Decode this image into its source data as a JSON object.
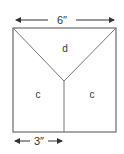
{
  "diagram": {
    "top_dimension": "6″",
    "bottom_dimension": "3″",
    "regions": {
      "top": "d",
      "bottom_left": "c",
      "bottom_right": "c"
    },
    "colors": {
      "line": "#777777",
      "text": "#333333",
      "background": "#ffffff"
    }
  }
}
